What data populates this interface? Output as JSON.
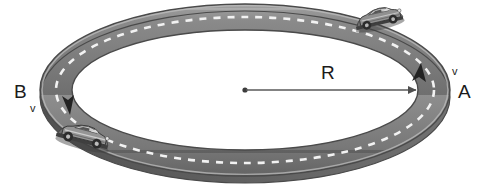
{
  "figure": {
    "background_color": "#ffffff"
  },
  "labels": {
    "point_a": "A",
    "point_b": "B",
    "radius": "R",
    "velocity_at_a": "v",
    "velocity_at_b": "v"
  },
  "geometry": {
    "center_x": 245,
    "center_y": 90,
    "outer_rx": 205,
    "outer_ry": 86,
    "inner_rx": 173,
    "inner_ry": 60,
    "radius_line_from_x": 245,
    "radius_line_to_x": 418,
    "radius_line_y": 90
  },
  "colors": {
    "asphalt": "#7c7c7c",
    "asphalt_dark": "#545454",
    "asphalt_light": "#a3a3a3",
    "lane_marking": "#f2f2f2",
    "edge_stroke": "#4a4a4a",
    "arrow": "#4f4f4f",
    "text": "#1b1b1b",
    "car_body": "#8a8a8a",
    "car_dark": "#3c3c3c",
    "car_highlight": "#d6d6d6"
  },
  "elements": {
    "track_name": "circular-racetrack",
    "center_dot_name": "track-center-point",
    "radius_arrow_name": "radius-arrow",
    "car_upper_right": "car-at-point-a",
    "car_lower_left": "car-at-point-b",
    "direction_arrow_a": "direction-arrow-a",
    "direction_arrow_b": "direction-arrow-b"
  }
}
